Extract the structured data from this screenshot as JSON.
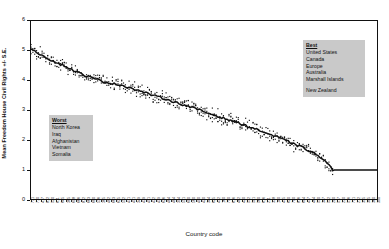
{
  "chart_data": {
    "type": "line",
    "title": "",
    "xlabel": "Country code",
    "ylabel": "Mean Freedom House Civil Rights +/- S.E.",
    "ylim": [
      0,
      6
    ],
    "yticks": [
      0,
      1,
      2,
      3,
      4,
      5,
      6
    ],
    "grid": false,
    "legend_position": "none",
    "series": [
      {
        "name": "Mean Freedom House Civil Rights",
        "values": [
          5.0,
          4.97,
          4.95,
          4.93,
          4.9,
          4.86,
          4.83,
          4.8,
          4.76,
          4.72,
          4.69,
          4.66,
          4.63,
          4.6,
          4.57,
          4.54,
          4.52,
          4.5,
          4.47,
          4.44,
          4.41,
          4.38,
          4.35,
          4.32,
          4.29,
          4.26,
          4.23,
          4.21,
          4.18,
          4.16,
          4.13,
          4.11,
          4.09,
          4.07,
          4.05,
          4.03,
          4.01,
          3.99,
          3.97,
          3.95,
          3.93,
          3.92,
          3.9,
          3.89,
          3.88,
          3.87,
          3.86,
          3.85,
          3.84,
          3.83,
          3.81,
          3.79,
          3.77,
          3.75,
          3.73,
          3.71,
          3.69,
          3.67,
          3.65,
          3.63,
          3.61,
          3.59,
          3.57,
          3.55,
          3.53,
          3.51,
          3.49,
          3.47,
          3.45,
          3.44,
          3.42,
          3.4,
          3.38,
          3.36,
          3.34,
          3.32,
          3.3,
          3.28,
          3.26,
          3.24,
          3.22,
          3.2,
          3.18,
          3.16,
          3.14,
          3.12,
          3.1,
          3.08,
          3.06,
          3.04,
          3.02,
          3.0,
          2.98,
          2.96,
          2.93,
          2.91,
          2.89,
          2.87,
          2.85,
          2.83,
          2.81,
          2.79,
          2.77,
          2.75,
          2.73,
          2.71,
          2.69,
          2.67,
          2.65,
          2.63,
          2.61,
          2.59,
          2.57,
          2.55,
          2.52,
          2.5,
          2.48,
          2.46,
          2.44,
          2.42,
          2.4,
          2.37,
          2.35,
          2.33,
          2.31,
          2.28,
          2.26,
          2.24,
          2.21,
          2.19,
          2.17,
          2.14,
          2.12,
          2.1,
          2.07,
          2.05,
          2.02,
          2.0,
          1.97,
          1.95,
          1.92,
          1.9,
          1.87,
          1.85,
          1.82,
          1.79,
          1.77,
          1.74,
          1.71,
          1.68,
          1.65,
          1.62,
          1.59,
          1.56,
          1.52,
          1.48,
          1.44,
          1.39,
          1.34,
          1.28,
          1.22,
          1.15,
          1.08,
          1.02,
          1.0,
          1.0,
          1.0,
          1.0,
          1.0,
          1.0,
          1.0,
          1.0,
          1.0,
          1.0,
          1.0,
          1.0,
          1.0,
          1.0,
          1.0,
          1.0,
          1.0,
          1.0,
          1.0,
          1.0,
          1.0,
          1.0,
          1.0,
          1.0
        ]
      }
    ],
    "standard_error": 0.11,
    "x_tick_labels": [
      "731",
      "710",
      "417",
      "812",
      "520",
      "611",
      "645",
      "365",
      "698",
      "666",
      "812",
      "663",
      "680",
      "536",
      "365",
      "482",
      "663",
      "625",
      "552",
      "471",
      "451",
      "349",
      "439",
      "451",
      "432",
      "439",
      "626",
      "484",
      "484",
      "394",
      "551",
      "600",
      "560",
      "490",
      "420",
      "344",
      "625",
      "432",
      "160",
      "750",
      "616",
      "482",
      "420",
      "572",
      "501",
      "560",
      "616",
      "211",
      "338",
      "140",
      "475",
      "620",
      "790",
      "816",
      "694",
      "437",
      "484",
      "530",
      "347",
      "522",
      "200",
      "517",
      "230",
      "516",
      "771",
      "212",
      "355",
      "305",
      "360",
      "390"
    ]
  },
  "annotations": {
    "best": {
      "heading": "Best",
      "items": [
        "United States",
        "Canada",
        "Europe",
        "Australia",
        "Marshall Islands"
      ],
      "items_after_gap": [
        "New Zealand"
      ],
      "background": "#c9c9c9"
    },
    "worst": {
      "heading": "Worst",
      "items": [
        "North Korea",
        "Iraq",
        "Afghanistan",
        "Vietnam",
        "Somalia"
      ],
      "background": "#c9c9c9"
    }
  },
  "style": {
    "line_color": "#111111",
    "marker_color": "#111111",
    "frame_color": "#111111",
    "page_background": "#ffffff"
  }
}
